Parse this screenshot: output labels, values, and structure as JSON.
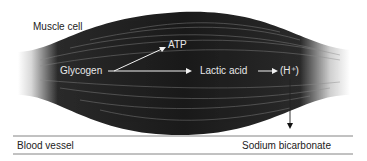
{
  "diagram": {
    "title": "",
    "labels": {
      "muscle_cell": "Muscle cell",
      "atp": "ATP",
      "glycogen": "Glycogen",
      "lactic_acid": "Lactic acid",
      "hydrogen_ion": "(H⁺)",
      "blood_vessel": "Blood vessel",
      "sodium_bicarbonate": "Sodium bicarbonate"
    },
    "edges": [
      {
        "from": "Glycogen",
        "to": "ATP"
      },
      {
        "from": "Glycogen",
        "to": "Lactic acid"
      },
      {
        "from": "Lactic acid",
        "to": "(H⁺)"
      },
      {
        "from": "(H⁺)",
        "to": "Blood vessel / Sodium bicarbonate"
      }
    ],
    "colors": {
      "muscle": "#1e1e1e",
      "arrows_inside": "#f0f0f0",
      "arrow_outside": "#111111",
      "lines": "#555555"
    }
  }
}
